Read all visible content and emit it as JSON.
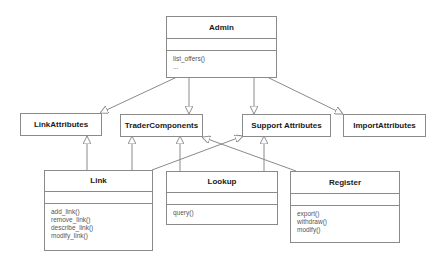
{
  "diagram": {
    "type": "uml-class-diagram",
    "classes": {
      "admin": {
        "name": "Admin",
        "operations": [
          "list_offers()",
          "..."
        ]
      },
      "link": {
        "name": "Link",
        "operations": [
          "add_link()",
          "remove_link()",
          "describe_link()",
          "modify_link()"
        ]
      },
      "lookup": {
        "name": "Lookup",
        "operations": [
          "query()"
        ]
      },
      "register": {
        "name": "Register",
        "operations": [
          "export()",
          "withdraw()",
          "modify()"
        ]
      }
    },
    "interfaces": {
      "link_attributes": "LinkAttributes",
      "trader_components": "TraderComponents",
      "support_attributes": "Support Attributes",
      "import_attributes": "ImportAttributes"
    },
    "relations": [
      {
        "from": "Admin",
        "to": "LinkAttributes",
        "kind": "generalization"
      },
      {
        "from": "Admin",
        "to": "TraderComponents",
        "kind": "generalization"
      },
      {
        "from": "Admin",
        "to": "Support Attributes",
        "kind": "generalization"
      },
      {
        "from": "Admin",
        "to": "ImportAttributes",
        "kind": "generalization"
      },
      {
        "from": "Link",
        "to": "LinkAttributes",
        "kind": "generalization"
      },
      {
        "from": "Link",
        "to": "TraderComponents",
        "kind": "generalization"
      },
      {
        "from": "Link",
        "to": "Support Attributes",
        "kind": "generalization"
      },
      {
        "from": "Lookup",
        "to": "TraderComponents",
        "kind": "generalization"
      },
      {
        "from": "Lookup",
        "to": "Support Attributes",
        "kind": "generalization"
      },
      {
        "from": "Register",
        "to": "TraderComponents",
        "kind": "generalization"
      }
    ],
    "colors": {
      "line": "#8a8a8a",
      "text": "#1a1a1a",
      "ops_text": "#555555"
    }
  }
}
